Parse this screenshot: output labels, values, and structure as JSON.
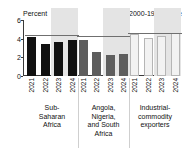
{
  "chart_data": {
    "type": "bar",
    "title": "",
    "subtitle": "",
    "unit_label": "Percent",
    "xlabel": "",
    "ylabel": "Percent",
    "ylim": [
      0,
      6
    ],
    "yticks": [
      "0",
      "2",
      "4",
      "6"
    ],
    "grid": false,
    "legend_position": "top-right",
    "legend": [
      {
        "label": "2000-19 average",
        "marker": "dash-line",
        "color": "#6f6f6f"
      }
    ],
    "categories": [
      "2021",
      "2022",
      "2023",
      "2024"
    ],
    "forecast_years": [
      "2023",
      "2024"
    ],
    "forecast_band_color": "#e4e4e4",
    "groups": [
      {
        "name": "Sub-Saharan Africa",
        "caption_lines": [
          "Sub-",
          "Saharan",
          "Africa"
        ],
        "color": "#111111",
        "values": [
          4.2,
          3.4,
          3.6,
          3.9
        ],
        "average": 4.4
      },
      {
        "name": "Angola, Nigeria, and South Africa",
        "caption_lines": [
          "Angola,",
          "Nigeria,",
          "and South",
          "Africa"
        ],
        "color": "#5e5e5e",
        "values": [
          3.9,
          2.6,
          2.3,
          2.4
        ],
        "average": 4.3
      },
      {
        "name": "Industrial-commodity exporters",
        "caption_lines": [
          "Industrial-",
          "commodity",
          "exporters"
        ],
        "color": "#f2f2f2",
        "values": [
          4.5,
          4.1,
          4.3,
          4.6
        ],
        "average": 4.6
      }
    ]
  }
}
